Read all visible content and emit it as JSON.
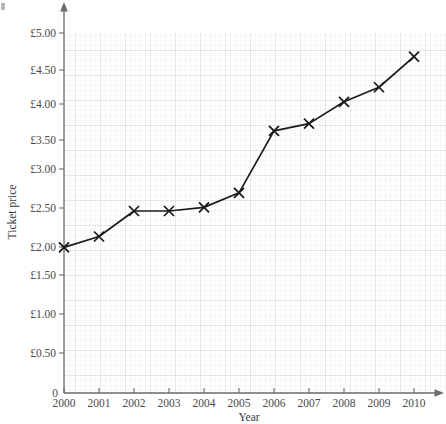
{
  "chart_data": {
    "type": "line",
    "title": "",
    "xlabel": "Year",
    "ylabel": "Ticket price",
    "categories": [
      "2000",
      "2001",
      "2002",
      "2003",
      "2004",
      "2005",
      "2006",
      "2007",
      "2008",
      "2009",
      "2010"
    ],
    "x": [
      2000,
      2001,
      2002,
      2003,
      2004,
      2005,
      2006,
      2007,
      2008,
      2009,
      2010
    ],
    "values": [
      2.0,
      2.15,
      2.5,
      2.5,
      2.55,
      2.75,
      3.6,
      3.7,
      4.0,
      4.2,
      4.62
    ],
    "series": [
      {
        "name": "Ticket price",
        "values": [
          2.0,
          2.15,
          2.5,
          2.5,
          2.55,
          2.75,
          3.6,
          3.7,
          4.0,
          4.2,
          4.62
        ]
      }
    ],
    "ylim": [
      0,
      5.35
    ],
    "xlim": [
      2000,
      2010
    ],
    "ytick_values": [
      0.5,
      1.0,
      1.5,
      2.0,
      2.5,
      3.0,
      3.5,
      4.0,
      4.5,
      5.0
    ],
    "ytick_labels": [
      "£0.50",
      "£1.00",
      "£1.50",
      "£2.00",
      "£2.50",
      "£3.00",
      "£3.50",
      "£4.00",
      "£4.50",
      "£5.00"
    ],
    "origin_label": "0",
    "grid": true,
    "grid_minor": true,
    "legend": "none",
    "marker": "x-cross",
    "line_color": "#1a1a1a",
    "grid_major_color": "#d0d0d0",
    "grid_minor_color": "#ededed",
    "axis_color": "#6a6a6a",
    "annotations": []
  },
  "axes": {
    "y_title": "Ticket price",
    "x_title": "Year",
    "origin": "0"
  }
}
